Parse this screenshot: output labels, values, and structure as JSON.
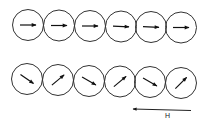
{
  "diagram": {
    "colors": {
      "stroke": "#333333",
      "arrow": "#111111",
      "background": "#ffffff"
    },
    "top_row": {
      "label": "aligned",
      "particles": [
        {
          "cx": 28,
          "cy": 25,
          "r": 15.5,
          "angle": 0
        },
        {
          "cx": 59,
          "cy": 25.5,
          "r": 15.5,
          "angle": 0
        },
        {
          "cx": 90,
          "cy": 26,
          "r": 15.5,
          "angle": 0
        },
        {
          "cx": 121,
          "cy": 26.5,
          "r": 15.5,
          "angle": 2
        },
        {
          "cx": 151,
          "cy": 27,
          "r": 15.5,
          "angle": 2
        },
        {
          "cx": 181,
          "cy": 27.5,
          "r": 15.5,
          "angle": 0
        }
      ]
    },
    "bottom_row": {
      "label": "alternating",
      "particles": [
        {
          "cx": 27,
          "cy": 79,
          "r": 15.5,
          "angle": 35
        },
        {
          "cx": 58,
          "cy": 80,
          "r": 15.5,
          "angle": -40
        },
        {
          "cx": 89,
          "cy": 81,
          "r": 15.5,
          "angle": 30
        },
        {
          "cx": 120,
          "cy": 81.5,
          "r": 15.5,
          "angle": -40
        },
        {
          "cx": 150,
          "cy": 82,
          "r": 15.5,
          "angle": 30
        },
        {
          "cx": 181,
          "cy": 83,
          "r": 15.5,
          "angle": -45
        }
      ]
    },
    "field": {
      "label": "H",
      "x1": 191,
      "y1": 110.5,
      "x2": 133,
      "y2": 109,
      "direction": "left"
    }
  }
}
